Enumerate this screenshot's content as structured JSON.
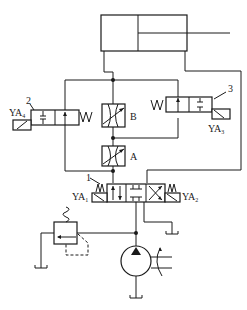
{
  "diagram": {
    "type": "hydraulic-circuit",
    "components": {
      "cylinder": {
        "name": "hydraulic-cylinder"
      },
      "valve_2": {
        "number": "2",
        "solenoid": "YA",
        "solenoid_sub": "4",
        "type": "2-position solenoid valve"
      },
      "valve_3": {
        "number": "3",
        "solenoid": "YA",
        "solenoid_sub": "3",
        "type": "2-position solenoid valve"
      },
      "throttle_B": {
        "label": "B",
        "type": "adjustable throttle valve"
      },
      "throttle_A": {
        "label": "A",
        "type": "adjustable throttle valve"
      },
      "valve_1": {
        "number": "1",
        "solenoid_left": "YA",
        "solenoid_left_sub": "1",
        "solenoid_right": "YA",
        "solenoid_right_sub": "2",
        "type": "3-position 4-way solenoid directional valve"
      },
      "relief_valve": {
        "type": "relief valve"
      },
      "pump": {
        "type": "hydraulic pump"
      }
    }
  }
}
